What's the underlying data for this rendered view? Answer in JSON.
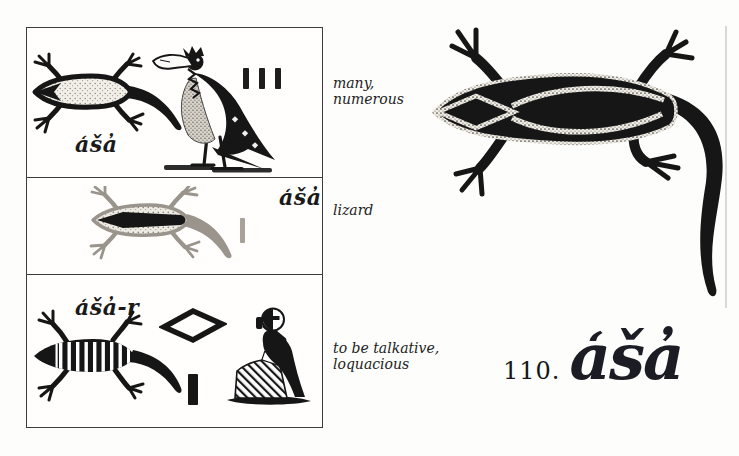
{
  "colors": {
    "ink": "#161616",
    "paper": "#ffffff",
    "stipple_light": "#8f887e"
  },
  "reference": {
    "number": "110.",
    "transliteration": "a̒ša̓"
  },
  "panels": [
    {
      "label": "a̒ša̓",
      "gloss": "many,\nnumerous",
      "signs": [
        "speckled lizard",
        "vulture",
        "three plural strokes"
      ]
    },
    {
      "label": "a̒ša̓",
      "gloss": "lizard",
      "signs": [
        "speckled lizard with dark dorsal stripe",
        "single stroke"
      ]
    },
    {
      "label": "a̒ša̓-r",
      "gloss": "to be talkative,\nloquacious",
      "signs": [
        "banded lizard",
        "lozenge (r)",
        "single stroke",
        "seated man with hand to mouth"
      ]
    }
  ],
  "illustration": {
    "subject": "striped lizard plate"
  }
}
